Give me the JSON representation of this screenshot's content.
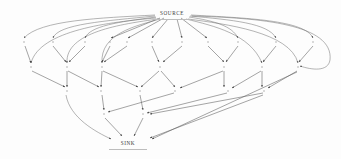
{
  "diagram": {
    "type": "directed-acyclic-graph",
    "canvas": {
      "width": 341,
      "height": 159,
      "background": "#fdfdfd"
    },
    "style": {
      "edge_color": "#5a5a5a",
      "node_color": "#9a9a9a",
      "label_color": "#3a3a3a",
      "arrowhead": "filled-triangle"
    },
    "terminals": {
      "source": {
        "label": "SOURCE",
        "x": 172,
        "y": 13
      },
      "sink": {
        "label": "SINK",
        "x": 128,
        "y": 143
      }
    },
    "layers": [
      {
        "name": "layer-1",
        "y": 42,
        "nodes": [
          {
            "id": "n1",
            "x": 24
          },
          {
            "id": "n2",
            "x": 53
          },
          {
            "id": "n3",
            "x": 85
          },
          {
            "id": "n4",
            "x": 110
          },
          {
            "id": "n5",
            "x": 127
          },
          {
            "id": "n6",
            "x": 152
          },
          {
            "id": "n7",
            "x": 182
          },
          {
            "id": "n8",
            "x": 208
          },
          {
            "id": "n9",
            "x": 238
          },
          {
            "id": "n10",
            "x": 276
          },
          {
            "id": "n11",
            "x": 313
          }
        ]
      },
      {
        "name": "layer-2",
        "y": 67,
        "nodes": [
          {
            "id": "m1",
            "x": 31
          },
          {
            "id": "m2",
            "x": 67
          },
          {
            "id": "m3",
            "x": 102
          },
          {
            "id": "m4",
            "x": 160
          },
          {
            "id": "m5",
            "x": 224
          },
          {
            "id": "m6",
            "x": 262
          },
          {
            "id": "m7",
            "x": 298
          }
        ]
      },
      {
        "name": "layer-3",
        "y": 91,
        "nodes": [
          {
            "id": "p1",
            "x": 67
          },
          {
            "id": "p2",
            "x": 101
          },
          {
            "id": "p3",
            "x": 140
          },
          {
            "id": "p4",
            "x": 175
          },
          {
            "id": "p5",
            "x": 228
          },
          {
            "id": "p6",
            "x": 264
          }
        ]
      },
      {
        "name": "layer-4",
        "y": 114,
        "nodes": [
          {
            "id": "q1",
            "x": 104
          },
          {
            "id": "q2",
            "x": 143
          }
        ]
      }
    ],
    "edge_count": 47,
    "node_count": 26
  }
}
